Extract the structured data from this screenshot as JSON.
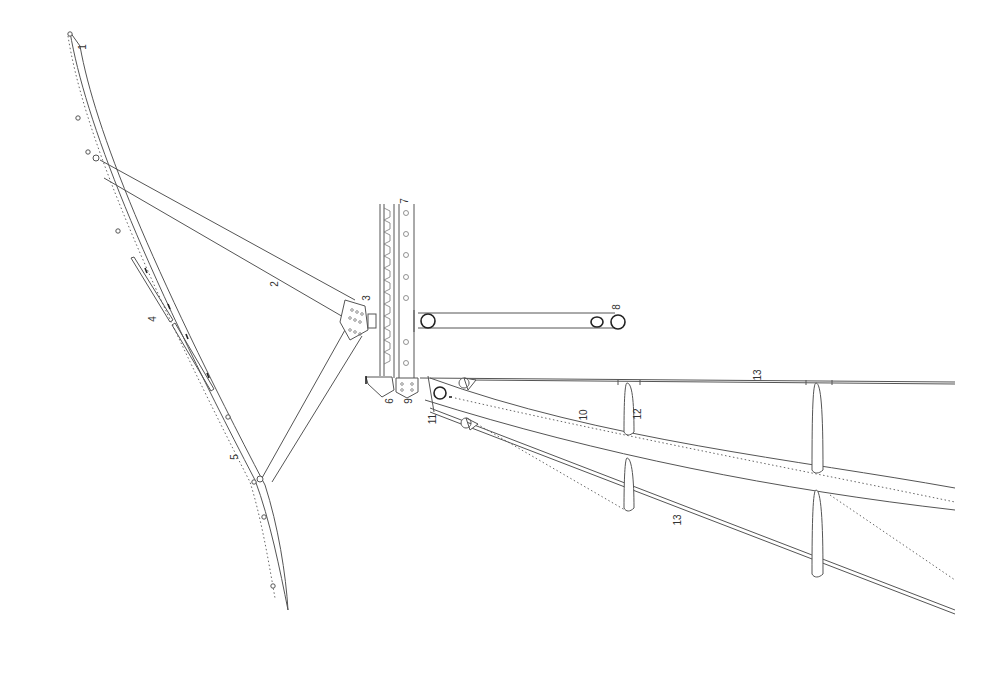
{
  "diagram": {
    "type": "technical line drawing",
    "background": "#ffffff",
    "stroke_color": "#555555",
    "labels": [
      {
        "id": "1",
        "text": "1",
        "x": 82,
        "y": 46
      },
      {
        "id": "2",
        "text": "2",
        "x": 274,
        "y": 283
      },
      {
        "id": "3",
        "text": "3",
        "x": 366,
        "y": 297
      },
      {
        "id": "4",
        "text": "4",
        "x": 152,
        "y": 318
      },
      {
        "id": "5",
        "text": "5",
        "x": 234,
        "y": 456
      },
      {
        "id": "6",
        "text": "6",
        "x": 389,
        "y": 400
      },
      {
        "id": "7",
        "text": "7",
        "x": 404,
        "y": 200
      },
      {
        "id": "8",
        "text": "8",
        "x": 616,
        "y": 306
      },
      {
        "id": "9",
        "text": "9",
        "x": 408,
        "y": 400
      },
      {
        "id": "10",
        "text": "10",
        "x": 582,
        "y": 414
      },
      {
        "id": "11",
        "text": "11",
        "x": 432,
        "y": 418
      },
      {
        "id": "12",
        "text": "12",
        "x": 636,
        "y": 413
      },
      {
        "id": "13a",
        "text": "13",
        "x": 756,
        "y": 374
      },
      {
        "id": "13b",
        "text": "13",
        "x": 676,
        "y": 519
      }
    ]
  }
}
